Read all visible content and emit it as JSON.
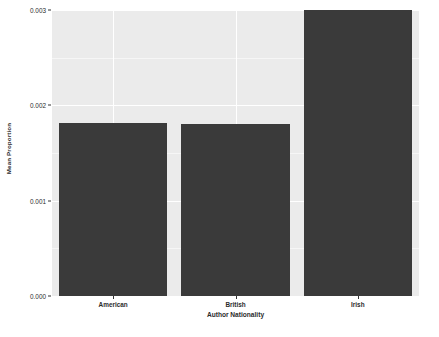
{
  "chart_data": {
    "type": "bar",
    "title": "",
    "subtitle": "",
    "xlabel": "Author Nationality",
    "ylabel": "Mean Proportion",
    "categories": [
      "American",
      "British",
      "Irish"
    ],
    "values": [
      0.00181,
      0.0018,
      0.003
    ],
    "series": [
      {
        "name": "Mean Proportion",
        "values": [
          0.00181,
          0.0018,
          0.003
        ]
      }
    ],
    "ylim": [
      0.0,
      0.003
    ],
    "xlim": [
      0,
      3
    ],
    "y_ticks": [
      0.0,
      0.001,
      0.002,
      0.003
    ],
    "y_tick_labels": [
      "0.000",
      "0.001",
      "0.002",
      "0.003"
    ],
    "y_minor_ticks": [
      0.0005,
      0.0015,
      0.0025
    ],
    "x_tick_labels": [
      "American",
      "British",
      "Irish"
    ],
    "grid": true,
    "legend": false,
    "legend_position": "none",
    "bar_color": "#3a3a3a",
    "panel_background": "#ebebeb",
    "gridline_color": "#ffffff",
    "figure_background": "#ffffff",
    "text_color": "#2b2b2b",
    "annotations": []
  }
}
